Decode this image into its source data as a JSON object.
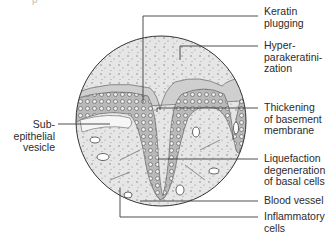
{
  "figure": {
    "type": "histology-illustration",
    "top_cropped_text": "p",
    "labels_right": [
      {
        "id": "keratin-plugging",
        "text": "Keratin\nplugging"
      },
      {
        "id": "hyperparakeratinization",
        "text": "Hyper-\nparakeratini-\nzation"
      },
      {
        "id": "thickening-basement-membrane",
        "text": "Thickening\nof basement\nmembrane"
      },
      {
        "id": "liquefaction-degeneration",
        "text": "Liquefaction\ndegeneration\nof basal cells"
      },
      {
        "id": "blood-vessel",
        "text": "Blood vessel"
      },
      {
        "id": "inflammatory-cells",
        "text": "Inflammatory\ncells"
      }
    ],
    "labels_left": [
      {
        "id": "subepithelial-vesicle",
        "text": "Sub-\nepithelial\nvesicle"
      }
    ],
    "colors": {
      "line": "#3a3a3a",
      "epithelium": "#8a8a8a",
      "connective": "#d9d9d9",
      "background": "#ffffff"
    }
  }
}
